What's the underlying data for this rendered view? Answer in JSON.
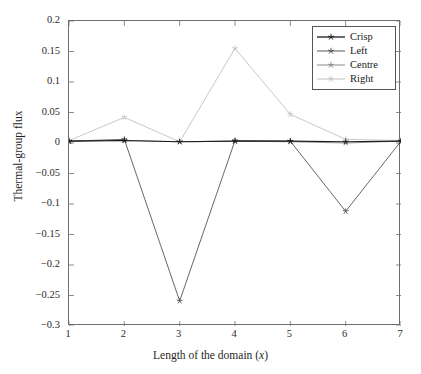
{
  "chart_data": {
    "type": "line",
    "title": "",
    "xlabel": "Length of the domain (x)",
    "ylabel": "Thermal-group flux",
    "xlim": [
      1,
      7
    ],
    "ylim": [
      -0.3,
      0.2
    ],
    "grid": false,
    "legend_position": "upper right",
    "x": [
      1,
      2,
      3,
      4,
      5,
      6,
      7
    ],
    "xticks": [
      "1",
      "2",
      "3",
      "4",
      "5",
      "6",
      "7"
    ],
    "yticks": [
      "0.2",
      "0.15",
      "0.1",
      "0.05",
      "0",
      "−0.05",
      "−0.1",
      "−0.15",
      "−0.2",
      "−0.25",
      "−0.3"
    ],
    "ytick_values": [
      0.2,
      0.15,
      0.1,
      0.05,
      0,
      -0.05,
      -0.1,
      -0.15,
      -0.2,
      -0.25,
      -0.3
    ],
    "series": [
      {
        "name": "Crisp",
        "color": "#1a1a1a",
        "marker": "star",
        "values": [
          0.003,
          0.004,
          0.002,
          0.003,
          0.003,
          0.002,
          0.003
        ]
      },
      {
        "name": "Left",
        "color": "#565656",
        "marker": "star",
        "values": [
          0.003,
          0.006,
          -0.259,
          0.004,
          0.003,
          -0.112,
          0.003
        ]
      },
      {
        "name": "Centre",
        "color": "#8c8c8c",
        "marker": "star",
        "values": [
          0.003,
          0.004,
          0.002,
          0.003,
          0.002,
          0.0,
          0.003
        ]
      },
      {
        "name": "Right",
        "color": "#c2c2c2",
        "marker": "star",
        "values": [
          0.004,
          0.042,
          0.002,
          0.155,
          0.047,
          0.006,
          0.004
        ]
      }
    ]
  },
  "legend": {
    "entries": [
      {
        "label": "Crisp"
      },
      {
        "label": "Left"
      },
      {
        "label": "Centre"
      },
      {
        "label": "Right"
      }
    ]
  },
  "axes": {
    "x_title_main": "Length of the domain (",
    "x_title_var": "x",
    "x_title_end": ")",
    "y_title": "Thermal-group flux"
  }
}
